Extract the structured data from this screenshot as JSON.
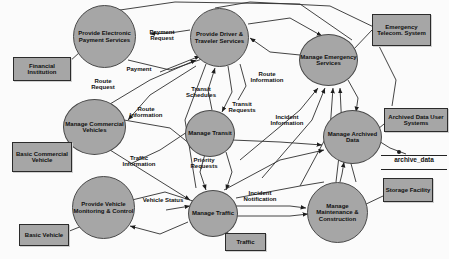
{
  "diagram": {
    "type": "data-flow-diagram",
    "colors": {
      "process_fill": "#a6a6a6",
      "terminator_fill": "#a6a6a6",
      "stroke": "#2b2b2b",
      "background": "#fbfbfb",
      "text": "#111111"
    },
    "processes": [
      {
        "id": "p_payment",
        "label": "Provide Electronic Payment Services",
        "x": 73,
        "y": 5,
        "w": 61,
        "h": 61
      },
      {
        "id": "p_driver",
        "label": "Provide Driver & Traveler Services",
        "x": 190,
        "y": 8,
        "w": 57,
        "h": 57
      },
      {
        "id": "p_emergency",
        "label": "Manage Emergency Services",
        "x": 299,
        "y": 34,
        "w": 57,
        "h": 50
      },
      {
        "id": "p_commercial",
        "label": "Manage Commercial Vehicles",
        "x": 63,
        "y": 99,
        "w": 61,
        "h": 54
      },
      {
        "id": "p_transit",
        "label": "Manage Transit",
        "x": 185,
        "y": 110,
        "w": 48,
        "h": 45
      },
      {
        "id": "p_archived",
        "label": "Manage Archived Data",
        "x": 323,
        "y": 110,
        "w": 57,
        "h": 52
      },
      {
        "id": "p_vehicle",
        "label": "Provide Vehicle Monitoring & Control",
        "x": 72,
        "y": 176,
        "w": 61,
        "h": 61
      },
      {
        "id": "p_traffic",
        "label": "Manage Traffic",
        "x": 188,
        "y": 190,
        "w": 48,
        "h": 45
      },
      {
        "id": "p_maint",
        "label": "Manage Maintenance & Construction",
        "x": 307,
        "y": 182,
        "w": 59,
        "h": 59
      }
    ],
    "terminators": [
      {
        "id": "t_financial",
        "label": "Financial Institution",
        "x": 13,
        "y": 57,
        "w": 56,
        "h": 22
      },
      {
        "id": "t_telecom",
        "label": "Emergency Telecom. System",
        "x": 372,
        "y": 14,
        "w": 57,
        "h": 30
      },
      {
        "id": "t_basiccomm",
        "label": "Basic Commercial Vehicle",
        "x": 12,
        "y": 142,
        "w": 58,
        "h": 28
      },
      {
        "id": "t_archuser",
        "label": "Archived Data User Systems",
        "x": 384,
        "y": 108,
        "w": 62,
        "h": 22
      },
      {
        "id": "t_storage",
        "label": "Storage Facility",
        "x": 383,
        "y": 178,
        "w": 48,
        "h": 22
      },
      {
        "id": "t_basicveh",
        "label": "Basic Vehicle",
        "x": 19,
        "y": 224,
        "w": 48,
        "h": 20
      },
      {
        "id": "t_traffic",
        "label": "Traffic",
        "x": 225,
        "y": 233,
        "w": 39,
        "h": 16
      }
    ],
    "datastores": [
      {
        "id": "d_archive",
        "label": "archive_data",
        "x": 381,
        "y": 155,
        "w": 66,
        "h": 13
      }
    ],
    "flows": [
      {
        "id": "f_payment_request",
        "label": "Payment Request",
        "x": 138,
        "y": 29,
        "w": 48
      },
      {
        "id": "f_payment",
        "label": "Payment",
        "x": 120,
        "y": 66,
        "w": 38
      },
      {
        "id": "f_route_request",
        "label": "Route Request",
        "x": 84,
        "y": 78,
        "w": 38
      },
      {
        "id": "f_route_info_top",
        "label": "Route Information",
        "x": 244,
        "y": 71,
        "w": 46
      },
      {
        "id": "f_transit_schedules",
        "label": "Transit Schedules",
        "x": 180,
        "y": 86,
        "w": 42
      },
      {
        "id": "f_transit_requests",
        "label": "Transit Requests",
        "x": 222,
        "y": 101,
        "w": 40
      },
      {
        "id": "f_route_info_left",
        "label": "Route Information",
        "x": 124,
        "y": 106,
        "w": 44
      },
      {
        "id": "f_incident_info",
        "label": "Incident Information",
        "x": 265,
        "y": 114,
        "w": 44
      },
      {
        "id": "f_traffic_info",
        "label": "Traffic Information",
        "x": 117,
        "y": 155,
        "w": 44
      },
      {
        "id": "f_priority_requests",
        "label": "Priority Requests",
        "x": 184,
        "y": 157,
        "w": 40
      },
      {
        "id": "f_vehicle_status",
        "label": "Vehicle Status",
        "x": 142,
        "y": 197,
        "w": 42
      },
      {
        "id": "f_incident_notif",
        "label": "Incident Notification",
        "x": 236,
        "y": 190,
        "w": 48
      }
    ]
  }
}
